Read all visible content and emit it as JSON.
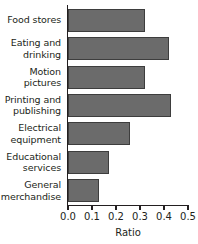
{
  "chart_data": {
    "type": "bar",
    "orientation": "horizontal",
    "title": "",
    "xlabel": "Ratio",
    "ylabel": "",
    "xlim": [
      0.0,
      0.5
    ],
    "xticks": [
      0.0,
      0.1,
      0.2,
      0.3,
      0.4,
      0.5
    ],
    "xticklabels": [
      "0.0",
      "0.1",
      "0.2",
      "0.3",
      "0.4",
      "0.5"
    ],
    "grid": false,
    "legend": false,
    "categories": [
      "Food stores",
      "Eating and drinking",
      "Motion pictures",
      "Printing and publishing",
      "Electrical equipment",
      "Educational services",
      "General merchandise"
    ],
    "category_lines": [
      [
        "Food stores"
      ],
      [
        "Eating and",
        "drinking"
      ],
      [
        "Motion",
        "pictures"
      ],
      [
        "Printing and",
        "publishing"
      ],
      [
        "Electrical",
        "equipment"
      ],
      [
        "Educational",
        "services"
      ],
      [
        "General",
        "merchandise"
      ]
    ],
    "values": [
      0.32,
      0.42,
      0.32,
      0.43,
      0.26,
      0.17,
      0.13
    ],
    "colors": {
      "bar_fill": "#6b6b6b",
      "bar_edge": "#3d3d3d",
      "axis": "#231f20",
      "text": "#231f20",
      "background": "#ffffff"
    }
  }
}
